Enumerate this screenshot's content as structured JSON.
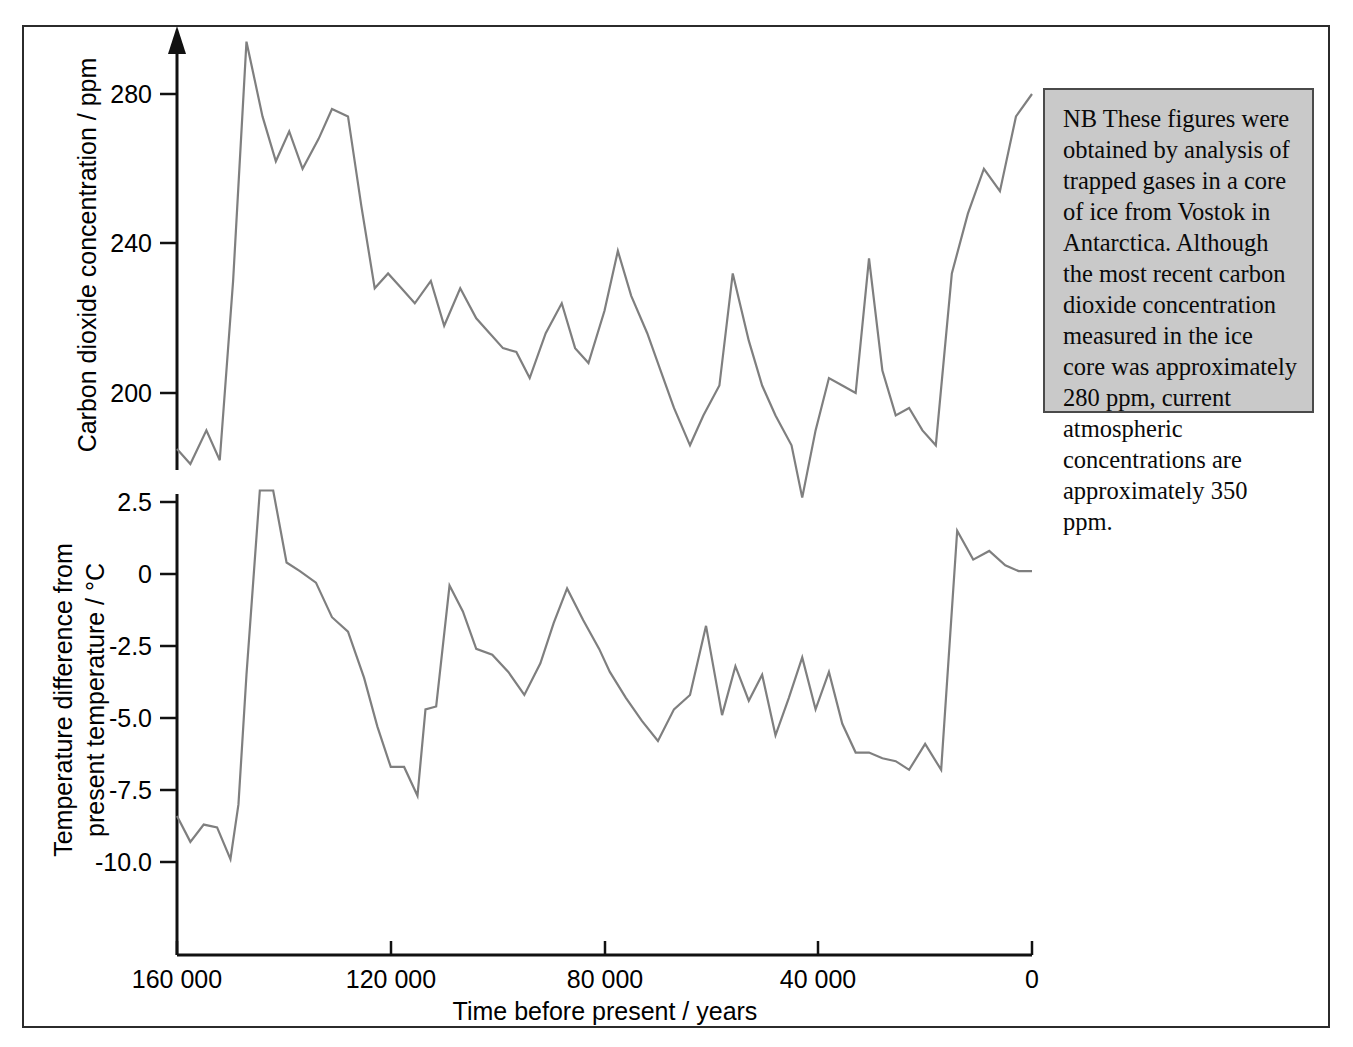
{
  "figure": {
    "note_box": {
      "name": "note-box",
      "text": "NB These figures were obtained by analysis of trapped gases in a core of ice from Vostok in Antarctica. Although the most recent carbon dioxide concentration measured in the ice core was approximately 280 ppm, current atmospheric concentrations are approximately 350 ppm."
    },
    "colors": {
      "data_line": "#7f7f7f",
      "axis": "#111111",
      "note_fill": "#c9c9c9",
      "note_border": "#4a4a4a",
      "frame": "#2b2b2b",
      "background": "#ffffff"
    }
  },
  "chart_data": [
    {
      "type": "line",
      "id": "co2-panel",
      "title": "",
      "xlabel": "Time before present / years",
      "ylabel": "Carbon dioxide concentration / ppm",
      "xlim": [
        160000,
        0
      ],
      "ylim": [
        168,
        300
      ],
      "x_reversed": true,
      "grid": false,
      "legend": "none",
      "yticks": [
        280,
        240,
        200
      ],
      "ytick_labels": [
        "280",
        "240",
        "200"
      ],
      "xticks": [
        160000,
        120000,
        80000,
        40000,
        0
      ],
      "xtick_labels": [
        "160 000",
        "120 000",
        "80 000",
        "40 000",
        "0"
      ],
      "series": [
        {
          "name": "Carbon dioxide concentration",
          "x": [
            160000,
            157500,
            154500,
            152000,
            149500,
            147000,
            144000,
            141500,
            139000,
            136500,
            133500,
            131000,
            128000,
            125500,
            123000,
            120500,
            118000,
            115500,
            112500,
            110000,
            107000,
            104000,
            101500,
            99000,
            96500,
            94000,
            91000,
            88000,
            85500,
            83000,
            80000,
            77500,
            75000,
            72000,
            69500,
            67000,
            64000,
            61500,
            58500,
            56000,
            53000,
            50500,
            48000,
            45000,
            43000,
            40500,
            38000,
            35500,
            33000,
            30500,
            28000,
            25500,
            23000,
            20500,
            18000,
            15000,
            12000,
            9000,
            6000,
            3000,
            0
          ],
          "y": [
            185,
            181,
            190,
            182,
            230,
            294,
            274,
            262,
            270,
            260,
            268,
            276,
            274,
            250,
            228,
            232,
            228,
            224,
            230,
            218,
            228,
            220,
            216,
            212,
            211,
            204,
            216,
            224,
            212,
            208,
            222,
            238,
            226,
            216,
            206,
            196,
            186,
            194,
            202,
            232,
            214,
            202,
            194,
            186,
            172,
            190,
            204,
            202,
            200,
            236,
            206,
            194,
            196,
            190,
            186,
            232,
            248,
            260,
            254,
            274,
            280
          ]
        }
      ]
    },
    {
      "type": "line",
      "id": "temperature-panel",
      "title": "",
      "xlabel": "Time before present / years",
      "ylabel": "Temperature difference from present temperature / °C",
      "xlim": [
        160000,
        0
      ],
      "ylim": [
        -10.8,
        3.1
      ],
      "x_reversed": true,
      "grid": false,
      "legend": "none",
      "yticks": [
        2.5,
        0,
        -2.5,
        -5.0,
        -7.5,
        -10.0
      ],
      "ytick_labels": [
        "2.5",
        "0",
        "-2.5",
        "-5.0",
        "-7.5",
        "-10.0"
      ],
      "xticks": [
        160000,
        120000,
        80000,
        40000,
        0
      ],
      "xtick_labels": [
        "160 000",
        "120 000",
        "80 000",
        "40 000",
        "0"
      ],
      "series": [
        {
          "name": "Temperature difference from present temperature",
          "x": [
            160000,
            157500,
            155000,
            152500,
            150000,
            148500,
            147000,
            144500,
            142000,
            139500,
            137000,
            134000,
            131000,
            128000,
            125000,
            122500,
            120000,
            117500,
            115000,
            113500,
            111500,
            109000,
            106500,
            104000,
            101000,
            98000,
            95000,
            92000,
            89500,
            87000,
            84000,
            81000,
            79000,
            76000,
            73000,
            70000,
            67000,
            64000,
            61000,
            58000,
            55500,
            53000,
            50500,
            48000,
            45500,
            43000,
            40500,
            38000,
            35500,
            33000,
            30500,
            28000,
            25500,
            23000,
            20000,
            17000,
            14000,
            11000,
            8000,
            5000,
            2500,
            0
          ],
          "y": [
            -8.4,
            -9.3,
            -8.7,
            -8.8,
            -9.9,
            -8.0,
            -3.5,
            2.9,
            2.9,
            0.4,
            0.1,
            -0.3,
            -1.5,
            -2.0,
            -3.6,
            -5.3,
            -6.7,
            -6.7,
            -7.7,
            -4.7,
            -4.6,
            -0.4,
            -1.3,
            -2.6,
            -2.8,
            -3.4,
            -4.2,
            -3.1,
            -1.7,
            -0.5,
            -1.6,
            -2.6,
            -3.4,
            -4.3,
            -5.1,
            -5.8,
            -4.7,
            -4.2,
            -1.8,
            -4.9,
            -3.2,
            -4.4,
            -3.5,
            -5.6,
            -4.3,
            -2.9,
            -4.7,
            -3.4,
            -5.2,
            -6.2,
            -6.2,
            -6.4,
            -6.5,
            -6.8,
            -5.9,
            -6.8,
            1.5,
            0.5,
            0.8,
            0.3,
            0.1,
            0.1
          ]
        }
      ]
    }
  ]
}
